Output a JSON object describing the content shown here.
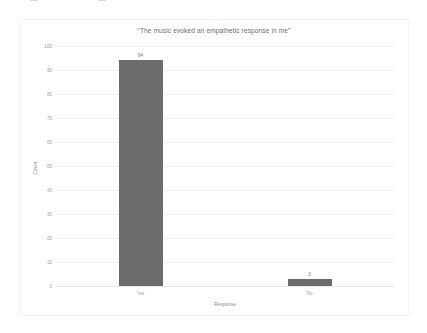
{
  "top_artifacts": [
    {
      "text": "▬",
      "left": 30
    },
    {
      "text": "▬",
      "left": 98
    }
  ],
  "chart_data": {
    "type": "bar",
    "title": "“The music evoked an empathetic response in me”",
    "xlabel": "Response",
    "ylabel": "Count",
    "categories": [
      "Yes",
      "No"
    ],
    "values": [
      94,
      3
    ],
    "value_labels": [
      "94",
      "3"
    ],
    "ylim": [
      0,
      100
    ],
    "yticks": [
      0,
      10,
      20,
      30,
      40,
      50,
      60,
      70,
      80,
      90,
      100
    ],
    "ytick_labels": [
      "0",
      "10",
      "20",
      "30",
      "40",
      "50",
      "60",
      "70",
      "80",
      "90",
      "100"
    ],
    "grid": true,
    "legend": false,
    "bar_color": "#6b6b6b",
    "grid_color": "#f0f0f3",
    "background_color": "#ffffff"
  }
}
